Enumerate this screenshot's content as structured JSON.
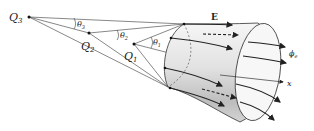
{
  "diagram": {
    "charges": [
      {
        "name": "Q3",
        "label": "Q",
        "sub": "3",
        "x": 29,
        "y": 17
      },
      {
        "name": "Q2",
        "label": "Q",
        "sub": "2",
        "x": 89,
        "y": 33
      },
      {
        "name": "Q1",
        "label": "Q",
        "sub": "1",
        "x": 134,
        "y": 44
      }
    ],
    "angles": [
      {
        "name": "theta3",
        "label": "θ",
        "sub": "3"
      },
      {
        "name": "theta2",
        "label": "θ",
        "sub": "2"
      },
      {
        "name": "theta1",
        "label": "θ",
        "sub": "1"
      }
    ],
    "field_label": "E",
    "flux_label": "ϕ",
    "flux_sub": "e",
    "axis_label": "x",
    "colors": {
      "line": "#333333",
      "surface_light": "#f4f4f4",
      "surface_dark": "#b8b8b8"
    }
  }
}
